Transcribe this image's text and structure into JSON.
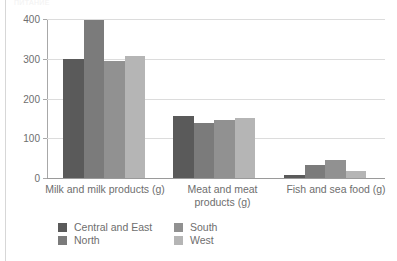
{
  "page": {
    "clipped_top_text": "ПИТАНИЕ",
    "rule_color": "#d7d7d7"
  },
  "chart_data": {
    "type": "bar",
    "title": "",
    "subtitle": "",
    "xlabel": "",
    "ylabel": "",
    "ylim": [
      0,
      400
    ],
    "yticks": [
      0,
      100,
      200,
      300,
      400
    ],
    "ytick_labels": [
      "0",
      "100",
      "200",
      "300",
      "400"
    ],
    "grid": true,
    "grid_axis": "y",
    "legend_position": "bottom-left",
    "orientation": "vertical",
    "grouping": "grouped",
    "categories": [
      "Milk and milk products (g)",
      "Meat and meat\nproducts (g)",
      "Fish and sea food (g)"
    ],
    "series": [
      {
        "name": "Central and East",
        "color": "#5a5a5a",
        "values": [
          300,
          155,
          8
        ]
      },
      {
        "name": "North",
        "color": "#7b7b7b",
        "values": [
          398,
          138,
          33
        ]
      },
      {
        "name": "South",
        "color": "#919191",
        "values": [
          295,
          145,
          46
        ]
      },
      {
        "name": "West",
        "color": "#b5b5b5",
        "values": [
          306,
          150,
          18
        ]
      }
    ]
  },
  "legend": {
    "entries": [
      {
        "label": "Central and East",
        "color": "#5a5a5a"
      },
      {
        "label": "South",
        "color": "#919191"
      },
      {
        "label": "North",
        "color": "#7b7b7b"
      },
      {
        "label": "West",
        "color": "#b5b5b5"
      }
    ]
  }
}
